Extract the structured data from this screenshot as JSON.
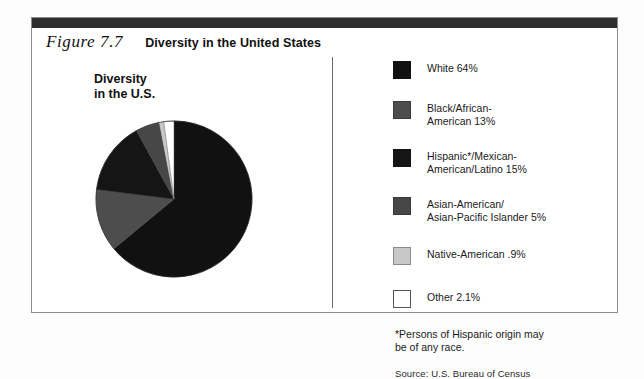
{
  "figure": {
    "number": "Figure 7.7",
    "title": "Diversity in the United States"
  },
  "chart": {
    "title": "Diversity\nin the U.S."
  },
  "legend": [
    {
      "label": "White 64%",
      "color": "#111111",
      "border": "#111111"
    },
    {
      "label": "Black/African-\nAmerican 13%",
      "color": "#4d4d4d",
      "border": "#3a3a3a"
    },
    {
      "label": "Hispanic*/Mexican-\nAmerican/Latino 15%",
      "color": "#151515",
      "border": "#151515"
    },
    {
      "label": "Asian-American/\nAsian-Pacific Islander 5%",
      "color": "#474747",
      "border": "#383838"
    },
    {
      "label": "Native-American .9%",
      "color": "#c8c8c8",
      "border": "#8a8a8a"
    },
    {
      "label": "Other 2.1%",
      "color": "#ffffff",
      "border": "#555555"
    }
  ],
  "footnote": "*Persons of Hispanic origin may\n be of any race.",
  "source": "Source: U.S. Bureau of Census",
  "chart_data": {
    "type": "pie",
    "title": "Diversity in the U.S.",
    "categories": [
      "White",
      "Black/African-American",
      "Hispanic*/Mexican-American/Latino",
      "Asian-American/Asian-Pacific Islander",
      "Native-American",
      "Other"
    ],
    "values": [
      64,
      13,
      15,
      5,
      0.9,
      2.1
    ],
    "unit": "percent",
    "colors": [
      "#111111",
      "#4d4d4d",
      "#151515",
      "#474747",
      "#c8c8c8",
      "#ffffff"
    ],
    "legend_position": "right",
    "start_angle": 0,
    "direction": "clockwise",
    "footnote": "*Persons of Hispanic origin may be of any race.",
    "source": "Source: U.S. Bureau of Census"
  }
}
